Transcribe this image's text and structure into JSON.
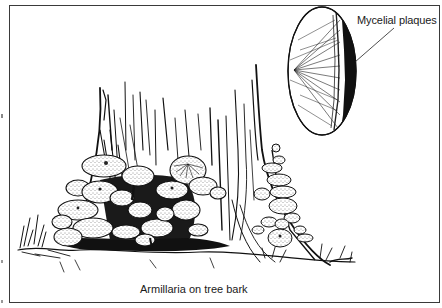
{
  "figure": {
    "callout": {
      "label": "Mycelial plaques",
      "target": "magnified-bark-inset"
    },
    "caption": "Armillaria on tree bark",
    "colors": {
      "ink": "#1a1a1a",
      "frame": "#3a3a3a",
      "background": "#ffffff"
    }
  }
}
